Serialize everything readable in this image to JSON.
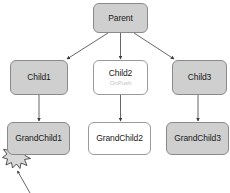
{
  "diagram": {
    "type": "component-tree",
    "title": "",
    "nodes": [
      {
        "id": "parent",
        "label": "Parent",
        "sublabel": "",
        "style": "filled"
      },
      {
        "id": "child1",
        "label": "Child1",
        "sublabel": "",
        "style": "filled"
      },
      {
        "id": "child2",
        "label": "Child2",
        "sublabel": "OnPush",
        "style": "hollow"
      },
      {
        "id": "child3",
        "label": "Child3",
        "sublabel": "",
        "style": "filled"
      },
      {
        "id": "grandchild1",
        "label": "GrandChild1",
        "sublabel": "",
        "style": "filled"
      },
      {
        "id": "grandchild2",
        "label": "GrandChild2",
        "sublabel": "",
        "style": "hollow"
      },
      {
        "id": "grandchild3",
        "label": "GrandChild3",
        "sublabel": "",
        "style": "filled"
      }
    ],
    "edges": [
      {
        "from": "parent",
        "to": "child1"
      },
      {
        "from": "parent",
        "to": "child2"
      },
      {
        "from": "parent",
        "to": "child3"
      },
      {
        "from": "child1",
        "to": "grandchild1"
      },
      {
        "from": "child2",
        "to": "grandchild2"
      },
      {
        "from": "child3",
        "to": "grandchild3"
      }
    ],
    "markers": [
      {
        "id": "event-burst",
        "kind": "starburst",
        "attached_to": "grandchild1",
        "label": ""
      }
    ],
    "annotations": [
      {
        "id": "burst-pointer",
        "kind": "arrow",
        "points_to": "event-burst",
        "label": ""
      }
    ],
    "colors": {
      "node_fill": "#cfcfcf",
      "node_hollow_fill": "#ffffff",
      "node_border": "#8c8c8c",
      "edge": "#555555",
      "sublabel": "#c2c2c2",
      "burst_fill": "#d8d8d8",
      "burst_border": "#3a3a3a",
      "background": "#ffffff"
    }
  }
}
